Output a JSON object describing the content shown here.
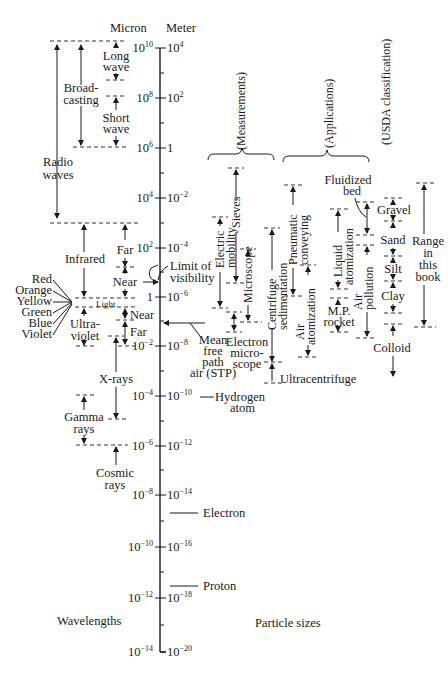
{
  "figure": {
    "axis_headers": {
      "micron": "Micron",
      "meter": "Meter"
    },
    "footer": {
      "left": "Wavelengths",
      "right": "Particle sizes"
    },
    "ticks": [
      {
        "micron": "10",
        "micron_exp": "10",
        "meter": "10",
        "meter_exp": "4",
        "y": 48
      },
      {
        "micron": "10",
        "micron_exp": "8",
        "meter": "10",
        "meter_exp": "2",
        "y": 98
      },
      {
        "micron": "10",
        "micron_exp": "6",
        "meter": "1",
        "meter_exp": "",
        "y": 148
      },
      {
        "micron": "10",
        "micron_exp": "4",
        "meter": "10",
        "meter_exp": "−2",
        "y": 198
      },
      {
        "micron": "10",
        "micron_exp": "2",
        "meter": "10",
        "meter_exp": "−4",
        "y": 248
      },
      {
        "micron": "1",
        "micron_exp": "",
        "meter": "10",
        "meter_exp": "−6",
        "y": 297
      },
      {
        "micron": "10",
        "micron_exp": "−2",
        "meter": "10",
        "meter_exp": "−8",
        "y": 346
      },
      {
        "micron": "10",
        "micron_exp": "−4",
        "meter": "10",
        "meter_exp": "−10",
        "y": 396
      },
      {
        "micron": "10",
        "micron_exp": "−6",
        "meter": "10",
        "meter_exp": "−12",
        "y": 446
      },
      {
        "micron": "10",
        "micron_exp": "−8",
        "meter": "10",
        "meter_exp": "−14",
        "y": 495
      },
      {
        "micron": "10",
        "micron_exp": "−10",
        "meter": "10",
        "meter_exp": "−16",
        "y": 547
      },
      {
        "micron": "10",
        "micron_exp": "−12",
        "meter": "10",
        "meter_exp": "−18",
        "y": 598
      },
      {
        "micron": "10",
        "micron_exp": "−14",
        "meter": "10",
        "meter_exp": "−20",
        "y": 652
      }
    ],
    "wavelengths": {
      "radio_waves": [
        "Radio",
        "waves"
      ],
      "broadcasting": [
        "Broad-",
        "casting"
      ],
      "long_wave": [
        "Long",
        "wave"
      ],
      "short_wave": [
        "Short",
        "wave"
      ],
      "infrared": "Infrared",
      "ir_far": "Far",
      "ir_near": "Near",
      "light": "Light",
      "colors": [
        "Red",
        "Orange",
        "Yellow",
        "Green",
        "Blue",
        "Violet"
      ],
      "ultraviolet": [
        "Ultra-",
        "violet"
      ],
      "uv_near": "Near",
      "uv_far": "Far",
      "x_rays": "X-rays",
      "gamma_rays": [
        "Gamma",
        "rays"
      ],
      "cosmic_rays": [
        "Cosmic",
        "rays"
      ]
    },
    "markers": {
      "limit_of_visibility": [
        "Limit of",
        "visibility"
      ],
      "mean_free_path": [
        "Mean",
        "free",
        "path",
        "air (STP)"
      ],
      "hydrogen_atom": [
        "Hydrogen",
        "atom"
      ],
      "electron": "Electron",
      "proton": "Proton"
    },
    "groups": {
      "measurements": "(Measurements)",
      "applications": "(Applications)",
      "usda": "(USDA classification)"
    },
    "measurements": {
      "sieves": "Sieves",
      "electric_mobility": [
        "Electric",
        "mobility"
      ],
      "microscope": "Microscope",
      "electron_microscope": [
        "Electron",
        "micro-",
        "scope"
      ],
      "centrifuge_sedimentation": [
        "Centrifuge",
        "sedimentation"
      ],
      "ultracentrifuge": "Ultracentrifuge"
    },
    "applications": {
      "pneumatic_conveying": [
        "Pneumatic",
        "conveying"
      ],
      "air_atomization": [
        "Air",
        "atomization"
      ],
      "liquid_atomization": [
        "Liquid",
        "atomization"
      ],
      "mp_rocket": [
        "M.P.",
        "rocket"
      ],
      "fluidized_bed": [
        "Fluidized",
        "bed"
      ],
      "air_pollution": [
        "Air",
        "pollution"
      ]
    },
    "usda": {
      "gravel": "Gravel",
      "sand": "Sand",
      "silt": "Silt",
      "clay": "Clay",
      "colloid": "Colloid"
    },
    "range": [
      "Range",
      "in",
      "this",
      "book"
    ]
  }
}
